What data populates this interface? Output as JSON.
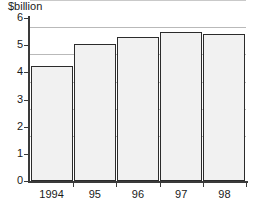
{
  "chart_data": {
    "type": "bar",
    "title": "$billion",
    "xlabel": "",
    "ylabel": "",
    "categories": [
      "1994",
      "95",
      "96",
      "97",
      "98"
    ],
    "values": [
      4.25,
      5.05,
      5.3,
      5.5,
      5.4
    ],
    "ylim": [
      0,
      6
    ],
    "ytick_labels": [
      "0",
      "1",
      "2",
      "3",
      "4",
      "5",
      "6"
    ],
    "ytick_values": [
      0,
      1,
      2,
      3,
      4,
      5,
      6
    ],
    "grid": true,
    "grid_axis": "y",
    "legend": null,
    "colors": {
      "bar_fill": "#f1f1f1",
      "bar_border": "#2b2b2b",
      "gridline": "#b9b9b9",
      "axis": "#3a3a3a",
      "text": "#1a1a1a",
      "background": "#ffffff"
    }
  }
}
